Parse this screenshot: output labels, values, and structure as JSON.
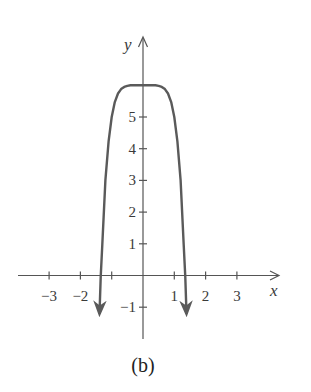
{
  "chart_data": {
    "type": "line",
    "title": "",
    "caption": "(b)",
    "xlabel": "x",
    "ylabel": "y",
    "xlim": [
      -4.1,
      4.3
    ],
    "ylim": [
      -2.2,
      7.3
    ],
    "grid": false,
    "x_ticks": [
      -3,
      -2,
      -1,
      1,
      2,
      3
    ],
    "x_tick_labels": [
      "−3",
      "−2",
      "",
      "1",
      "2",
      "3"
    ],
    "y_ticks": [
      -1,
      1,
      2,
      3,
      4,
      5
    ],
    "y_tick_labels": [
      "−1",
      "1",
      "2",
      "3",
      "4",
      "5"
    ],
    "series": [
      {
        "name": "y = 6 − x^6",
        "color": "#5a5a5a",
        "end_arrows": true,
        "x": [
          -1.39,
          -1.35,
          -1.3,
          -1.2,
          -1.1,
          -1.0,
          -0.9,
          -0.8,
          -0.7,
          -0.6,
          -0.5,
          -0.4,
          -0.3,
          -0.2,
          -0.1,
          0,
          0.1,
          0.2,
          0.3,
          0.4,
          0.5,
          0.6,
          0.7,
          0.8,
          0.9,
          1.0,
          1.1,
          1.2,
          1.3,
          1.35,
          1.39
        ],
        "y": [
          -1.21,
          -0.05,
          0.97,
          3.01,
          4.23,
          5.0,
          5.47,
          5.74,
          5.88,
          5.95,
          5.98,
          6.0,
          6.0,
          6.0,
          6.0,
          6.0,
          6.0,
          6.0,
          6.0,
          6.0,
          5.98,
          5.95,
          5.88,
          5.74,
          5.47,
          5.0,
          4.23,
          3.01,
          0.97,
          -0.05,
          -1.21
        ]
      }
    ]
  }
}
